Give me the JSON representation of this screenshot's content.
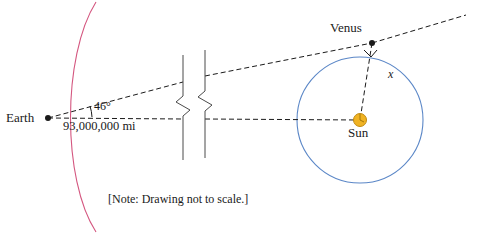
{
  "diagram": {
    "note": "[Note: Drawing not to scale.]",
    "labels": {
      "earth": "Earth",
      "venus": "Venus",
      "sun": "Sun",
      "angle": "46°",
      "distance": "93,000,000 mi",
      "unknown": "x"
    },
    "colors": {
      "earth_orbit_arc": "#d4567f",
      "venus_orbit_circle": "#5b87c7",
      "sun_fill": "#f0b323",
      "sun_stroke": "#c08a10",
      "line": "#1a1a1a",
      "text": "#1a1a1a",
      "background": "#ffffff"
    },
    "geometry": {
      "earth_point": [
        48,
        118
      ],
      "sun_point": [
        360,
        120
      ],
      "venus_point": [
        372,
        43
      ],
      "venus_orbit_radius": 63,
      "sight_line_end": [
        466,
        15
      ],
      "break_symbol_x": [
        183,
        205
      ]
    }
  }
}
